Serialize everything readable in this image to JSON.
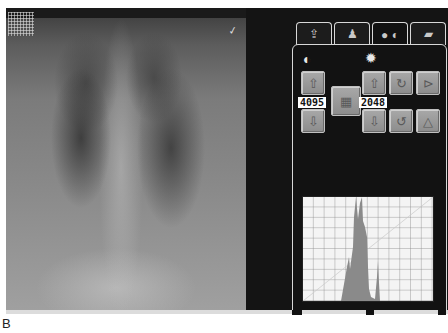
{
  "viewer": {
    "image_label": "chest-xray",
    "marker_glyph": "✓"
  },
  "tabs": [
    {
      "name": "image-transfer",
      "glyph": "⇪",
      "active": false
    },
    {
      "name": "patient",
      "glyph": "♟",
      "active": false
    },
    {
      "name": "brightness-contrast",
      "glyph": "● ◐",
      "active": true
    },
    {
      "name": "tools",
      "glyph": "▰",
      "active": false
    }
  ],
  "controls": {
    "contrast_icon": "◐",
    "brightness_icon": "✹",
    "window_width_value": "4095",
    "window_level_value": "2048",
    "buttons": {
      "width_up": "⇧",
      "width_down": "⇩",
      "curve": "▦",
      "level_up": "⇧",
      "level_down": "⇩",
      "rotate_cw": "↻",
      "rotate_ccw": "↺",
      "flip_horizontal": "⊳",
      "flip_vertical": "△"
    }
  },
  "caption": "B",
  "colors": {
    "panel_bg": "#121212",
    "button_face": "#9c9c9c",
    "histogram_fill": "#8a8a8a",
    "histogram_grid": "#7a7a7a"
  }
}
